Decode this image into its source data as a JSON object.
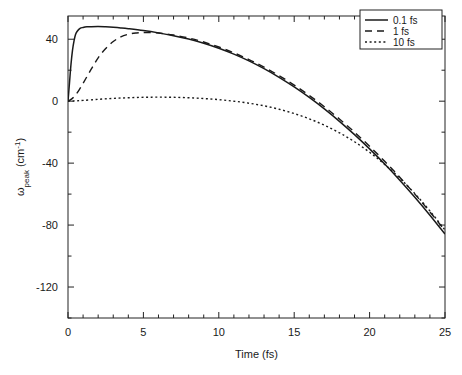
{
  "chart_data": {
    "type": "line",
    "title": "",
    "xlabel": "Time (fs)",
    "ylabel": "ωpeak (cm⁻¹)",
    "ylabel_main": "ω",
    "ylabel_sub": "peak",
    "ylabel_unit": " (cm",
    "ylabel_sup": "-1",
    "ylabel_close": ")",
    "xlim": [
      0,
      25
    ],
    "ylim": [
      -140,
      55
    ],
    "grid": false,
    "legend_position": "top-right",
    "xticks": [
      0,
      5,
      10,
      15,
      20,
      25
    ],
    "xtick_labels": [
      "0",
      "5",
      "10",
      "15",
      "20",
      "25"
    ],
    "x_minor_step": 1,
    "yticks": [
      40,
      0,
      -40,
      -80,
      -120
    ],
    "ytick_labels": [
      "40",
      "0",
      "-40",
      "-80",
      "-120"
    ],
    "y_minor_step": 20,
    "series": [
      {
        "name": "0.1 fs",
        "style": "solid",
        "x": [
          0,
          0.1,
          0.2,
          0.3,
          0.4,
          0.5,
          0.6,
          0.8,
          1.0,
          1.25,
          1.5,
          2.0,
          2.5,
          3.0,
          3.5,
          4.0,
          5.0,
          6.0,
          7.0,
          8.0,
          9.0,
          10.0,
          11.0,
          12.0,
          13.0,
          14.0,
          15.0,
          16.0,
          17.0,
          18.0,
          19.0,
          20.0,
          21.0,
          22.0,
          23.0,
          24.0,
          25.0
        ],
        "y": [
          0,
          12,
          24,
          33,
          39,
          43,
          45,
          47,
          47.6,
          48,
          48.1,
          48.2,
          48.0,
          47.7,
          47.3,
          46.8,
          45.6,
          44.1,
          42.3,
          40.1,
          37.4,
          34.2,
          30.4,
          26.0,
          21.0,
          15.4,
          9.2,
          2.4,
          -5.0,
          -13.0,
          -21.6,
          -30.8,
          -40.6,
          -51.0,
          -62.0,
          -73.6,
          -85.8
        ]
      },
      {
        "name": "1 fs",
        "style": "dashed",
        "x": [
          0,
          0.25,
          0.5,
          0.75,
          1.0,
          1.5,
          2.0,
          2.5,
          3.0,
          3.5,
          4.0,
          4.5,
          5.0,
          6.0,
          7.0,
          8.0,
          9.0,
          10.0,
          11.0,
          12.0,
          13.0,
          14.0,
          15.0,
          16.0,
          17.0,
          18.0,
          19.0,
          20.0,
          21.0,
          22.0,
          23.0,
          24.0,
          25.0
        ],
        "y": [
          0,
          1.5,
          4.0,
          7.5,
          11.5,
          20.0,
          28.0,
          34.0,
          38.5,
          41.5,
          43.2,
          44.0,
          44.3,
          44.0,
          42.7,
          40.8,
          38.2,
          35.0,
          31.2,
          26.9,
          22.0,
          16.5,
          10.4,
          3.7,
          -3.6,
          -11.5,
          -20.0,
          -29.1,
          -38.8,
          -49.1,
          -60.0,
          -71.5,
          -83.6
        ]
      },
      {
        "name": "10 fs",
        "style": "dotted",
        "x": [
          0,
          0.5,
          1.0,
          2.0,
          3.0,
          4.0,
          5.0,
          6.0,
          7.0,
          8.0,
          9.0,
          10.0,
          11.0,
          12.0,
          13.0,
          14.0,
          15.0,
          16.0,
          17.0,
          18.0,
          19.0,
          20.0,
          21.0,
          22.0,
          23.0,
          24.0,
          25.0
        ],
        "y": [
          0,
          0.2,
          0.5,
          1.2,
          1.8,
          2.2,
          2.5,
          2.6,
          2.5,
          2.2,
          1.7,
          1.0,
          0.0,
          -1.3,
          -3.0,
          -5.2,
          -8.0,
          -11.4,
          -15.5,
          -20.4,
          -26.2,
          -33.0,
          -40.8,
          -49.7,
          -59.7,
          -70.9,
          -83.2
        ]
      }
    ],
    "legend_entries": [
      {
        "label": "0.1 fs",
        "style": "solid"
      },
      {
        "label": "1 fs",
        "style": "dashed"
      },
      {
        "label": "10 fs",
        "style": "dotted"
      }
    ]
  }
}
